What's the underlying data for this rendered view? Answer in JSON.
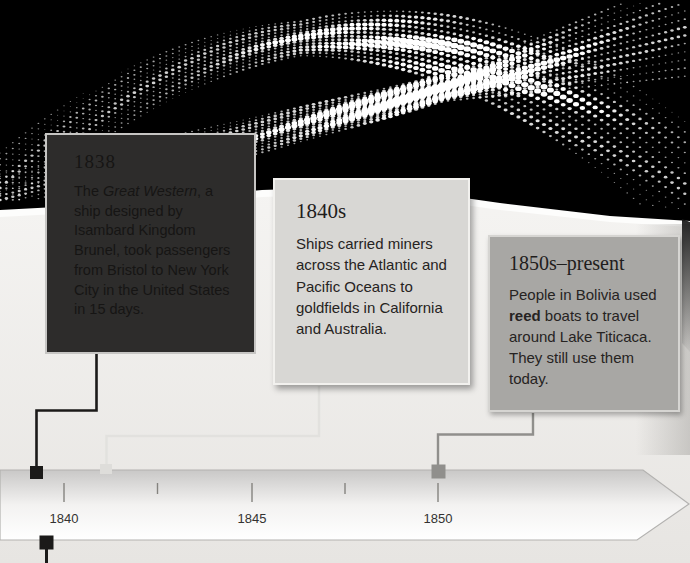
{
  "cards": [
    {
      "heading": "1838",
      "body_segments": [
        {
          "text": "The "
        },
        {
          "text": "Great Western",
          "emphasis": "italic"
        },
        {
          "text": ", a ship designed by Isambard Kingdom Brunel, took passengers from Bristol to New York City in the United States in 15 days."
        }
      ]
    },
    {
      "heading": "1840s",
      "body_segments": [
        {
          "text": "Ships carried miners across the Atlantic and Pacific Oceans to goldfields in California and Australia."
        }
      ]
    },
    {
      "heading": "1850s–present",
      "body_segments": [
        {
          "text": "People in Bolivia used "
        },
        {
          "text": "reed",
          "emphasis": "bold"
        },
        {
          "text": " boats to travel around Lake Titicaca. They still use them today."
        }
      ]
    }
  ],
  "timeline": {
    "tick_labels": [
      "1840",
      "1845",
      "1850"
    ]
  },
  "theme": {
    "colors": {
      "card1-bg": "#2d2c2b",
      "card1-border": "#c6c5c3",
      "card1-text": "#161514",
      "card2-bg": "#d8d7d4",
      "card2-border": "#f2f1ee",
      "card3-bg": "#a8a7a4",
      "card3-border": "#d6d5d2",
      "card23-heading": "#1f1d1c",
      "card23-text": "#262322",
      "panel-top": "#f5f4f2",
      "panel-bottom": "#e7e5e2",
      "panel-edge": "#fdfdfc",
      "band-stroke": "#b3b2b0",
      "connector1": "#1b1a19",
      "connector2": "#e2e1de",
      "marker2": "#deddda",
      "connector3": "#908f8c",
      "tick-color": "#85837f",
      "tick-label-color": "#333231",
      "wave-dot": "#ffffff"
    }
  },
  "wave": {
    "dot_color": "#ffffff"
  }
}
